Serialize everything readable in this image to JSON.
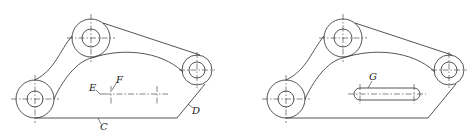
{
  "figures": [
    {
      "id": "left",
      "labels": {
        "C": "C",
        "D": "D",
        "E": "E",
        "F": "F"
      }
    },
    {
      "id": "right",
      "labels": {
        "G": "G"
      }
    }
  ]
}
